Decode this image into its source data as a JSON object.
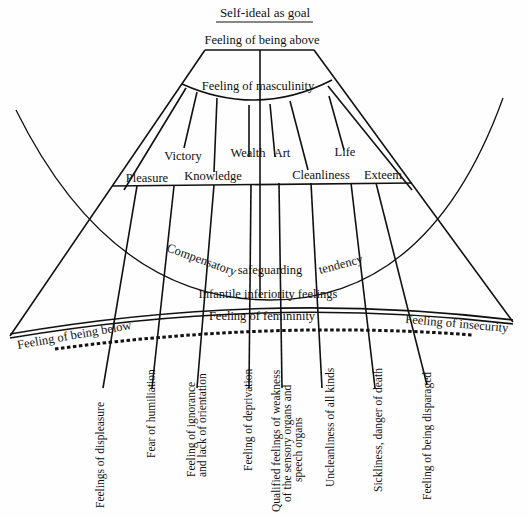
{
  "title": "Self-ideal as goal",
  "top": {
    "apex": "Feeling of being above",
    "inner_arc": "Feeling of masculinity"
  },
  "goals": {
    "upper_row": [
      "Victory",
      "Wealth",
      "Art",
      "Life"
    ],
    "lower_row": [
      "Pleasure",
      "Knowledge",
      "Cleanliness",
      "Exteem"
    ]
  },
  "middle_arc": {
    "words": [
      "Compensatory",
      "safeguarding",
      "tendency"
    ]
  },
  "base": {
    "inferiority": "Infantile inferiority feelings",
    "femininity": "Feeling of femininity",
    "left": "Feeling of being below",
    "right": "Feeling of insecurity"
  },
  "bottom_labels": [
    {
      "lines": [
        "Feelings of displeasure"
      ]
    },
    {
      "lines": [
        "Fear of humiliation"
      ]
    },
    {
      "lines": [
        "Feeling of ignorance",
        "and lack of orientation"
      ]
    },
    {
      "lines": [
        "Feeling of deprivation"
      ]
    },
    {
      "lines": [
        "Qualified feelings of weakness",
        "of the sensory organs and",
        "speech organs"
      ]
    },
    {
      "lines": [
        "Uncleanliness of all kinds"
      ]
    },
    {
      "lines": [
        "Sickliness, danger of death"
      ]
    },
    {
      "lines": [
        "Feeling of being disparaged"
      ]
    }
  ]
}
